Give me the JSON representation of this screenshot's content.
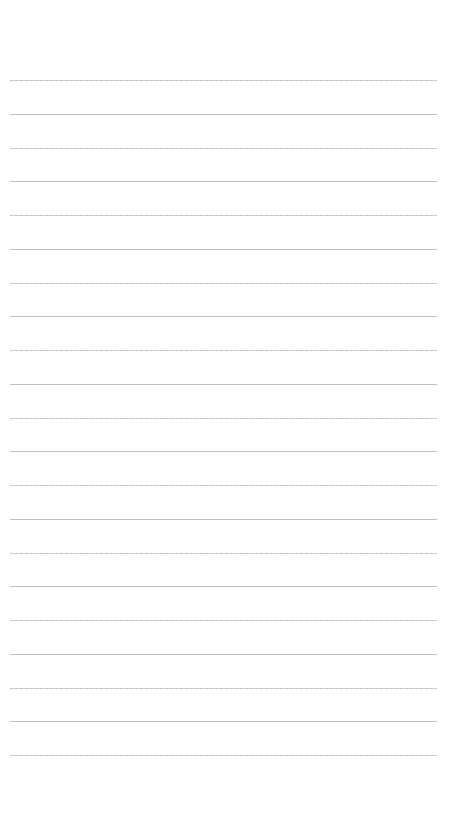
{
  "page": {
    "type": "lined-paper",
    "background_color": "#ffffff",
    "rule_color": "#b4b4b4",
    "rule_count": 21,
    "first_rule_y": 80,
    "rule_spacing": 33.75,
    "rule_left": 10,
    "rule_right": 437,
    "text_content": []
  }
}
